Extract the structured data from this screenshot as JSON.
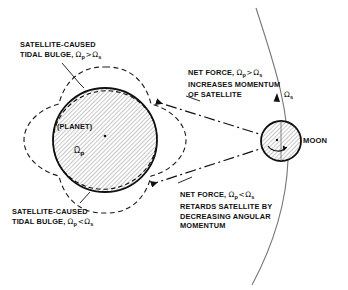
{
  "figure": {
    "background_color": "#ffffff",
    "ink_color": "#111111",
    "hatch_color": "#8a8a8a"
  },
  "labels": {
    "bulge_top": {
      "line1": "SATELLITE-CAUSED",
      "line2_prefix": "TIDAL BULGE, ",
      "omega": "Ω",
      "sub1": "p",
      "relation": ">",
      "omega2": "Ω",
      "sub2": "s"
    },
    "bulge_bottom": {
      "line1": "SATELLITE-CAUSED",
      "line2_prefix": "TIDAL BULGE, ",
      "omega": "Ω",
      "sub1": "p",
      "relation": "<",
      "omega2": "Ω",
      "sub2": "s"
    },
    "force_top": {
      "line1_prefix": "NET FORCE, ",
      "omega": "Ω",
      "sub1": "p",
      "relation": ">",
      "omega2": "Ω",
      "sub2": "s",
      "line2": "INCREASES MOMENTUM",
      "line3": "OF SATELLITE"
    },
    "force_bottom": {
      "line1_prefix": "NET FORCE, ",
      "omega": "Ω",
      "sub1": "p",
      "relation": "<",
      "omega2": "Ω",
      "sub2": "s",
      "line2": "RETARDS SATELLITE BY",
      "line3": "DECREASING ANGULAR",
      "line4": "MOMENTUM"
    },
    "planet": "(PLANET)",
    "planet_omega": "Ω",
    "planet_omega_sub": "p",
    "moon": "MOON",
    "orbit_omega": "Ω",
    "orbit_omega_sub": "s"
  }
}
